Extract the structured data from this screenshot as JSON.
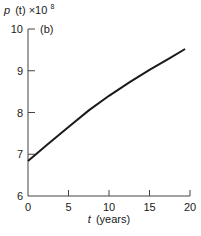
{
  "chart_data": {
    "type": "line",
    "title": "",
    "panel_label": "(b)",
    "ylabel": "p (t) ×10^8",
    "ylabel_parts": {
      "var": "p",
      "arg": "(t)",
      "times": "×10",
      "exp": "8"
    },
    "xlabel": "t (years)",
    "xlabel_parts": {
      "var": "t",
      "unit": "(years)"
    },
    "xlim": [
      0,
      20
    ],
    "ylim": [
      6,
      10
    ],
    "x_ticks": [
      0,
      5,
      10,
      15,
      20
    ],
    "y_ticks": [
      6,
      7,
      8,
      9,
      10
    ],
    "grid": false,
    "legend": null,
    "series": [
      {
        "name": "p(t)",
        "x": [
          0,
          2.5,
          5,
          7.5,
          10,
          12.5,
          15,
          17.5,
          19.4
        ],
        "values": [
          6.84,
          7.25,
          7.65,
          8.05,
          8.4,
          8.72,
          9.02,
          9.3,
          9.52
        ]
      }
    ]
  }
}
